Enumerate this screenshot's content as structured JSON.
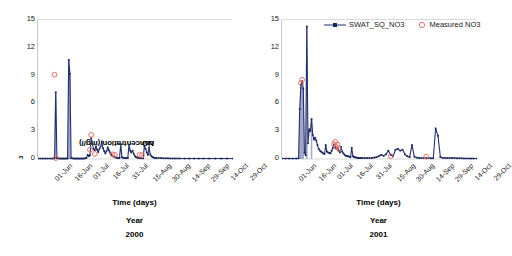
{
  "figure": {
    "ylabel": "NO3 concentration (mg/l)",
    "ylabel_prefix": "NO",
    "ylabel_sub": "3",
    "ylabel_suffix": " concentration (mg/l)",
    "colors": {
      "simulated_line": "#24306e",
      "simulated_marker": "#1b2559",
      "measured_marker": "#e8736c",
      "measured_fill": "#ffffff",
      "axis": "#c8c8c8",
      "gridline": "#d9d9d9",
      "text": "#1a1a1a",
      "spike_stem": "#8b90bc"
    },
    "legend": {
      "position": "top-right-of-right-panel",
      "entries": [
        {
          "label": "SWAT_SQ_NO3",
          "marker": "line-with-square-marker"
        },
        {
          "label": "Measured NO3",
          "marker": "open-circle"
        }
      ]
    }
  },
  "chart_data": [
    {
      "id": "panel-2000",
      "type": "line",
      "title": "",
      "xlabel": "Time (days)",
      "ylabel": "NO3 concentration (mg/l)",
      "caption_line1": "Year",
      "caption_line2": "2000",
      "grid": false,
      "ylim": [
        0,
        15
      ],
      "yticks": [
        0,
        3,
        6,
        9,
        12,
        15
      ],
      "xticklabels": [
        "01-Jun",
        "16-Jun",
        "01-Jul",
        "16-Jul",
        "31-Jul",
        "15-Aug",
        "30-Aug",
        "14-Sep",
        "29-Sep",
        "14-Oct",
        "29-Oct"
      ],
      "xlim_days": [
        0,
        165
      ],
      "series": [
        {
          "name": "SWAT_SQ_NO3",
          "x": [
            0,
            2,
            4,
            6,
            8,
            10,
            12,
            13,
            14,
            15,
            16,
            17,
            18,
            19,
            20,
            21,
            22,
            23,
            24,
            25,
            26,
            27,
            28,
            29,
            30,
            31,
            32,
            33,
            34,
            35,
            36,
            37,
            38,
            39,
            40,
            41,
            42,
            43,
            44,
            45,
            46,
            47,
            48,
            49,
            50,
            51,
            52,
            53,
            54,
            55,
            56,
            57,
            58,
            59,
            60,
            61,
            62,
            63,
            64,
            65,
            66,
            67,
            68,
            69,
            70,
            71,
            72,
            73,
            74,
            75,
            76,
            77,
            78,
            79,
            80,
            81,
            82,
            83,
            84,
            85,
            86,
            87,
            88,
            89,
            90,
            91,
            92,
            93,
            94,
            95,
            96,
            97,
            98,
            99,
            100,
            102,
            104,
            106,
            108,
            110,
            112,
            114,
            116,
            118,
            120,
            124,
            128,
            132,
            136,
            140,
            145,
            150,
            155,
            160,
            165
          ],
          "y": [
            0.05,
            0.05,
            0.05,
            0.05,
            0.05,
            0.05,
            0.05,
            0.05,
            0.08,
            7.2,
            0.1,
            0.08,
            0.05,
            0.05,
            0.05,
            0.05,
            0.05,
            0.05,
            0.05,
            0.05,
            10.7,
            9.2,
            0.1,
            0.08,
            0.05,
            0.05,
            0.05,
            0.05,
            0.05,
            0.05,
            0.05,
            0.05,
            0.05,
            0.05,
            0.08,
            0.12,
            0.45,
            0.3,
            0.4,
            2.3,
            1.65,
            1.1,
            0.95,
            1.35,
            1.0,
            0.75,
            1.1,
            1.35,
            1.9,
            1.15,
            0.85,
            0.6,
            0.85,
            1.25,
            0.95,
            0.7,
            0.5,
            0.35,
            0.25,
            0.2,
            0.15,
            0.12,
            0.1,
            0.1,
            1.6,
            0.2,
            0.12,
            0.1,
            0.1,
            0.1,
            0.12,
            1.55,
            0.9,
            0.7,
            0.9,
            0.55,
            0.3,
            0.2,
            0.15,
            0.12,
            0.1,
            0.1,
            0.08,
            0.08,
            1.4,
            1.1,
            0.7,
            0.45,
            1.25,
            0.5,
            0.3,
            0.2,
            0.15,
            0.12,
            0.1,
            0.1,
            0.1,
            0.08,
            0.08,
            0.08,
            0.06,
            0.06,
            0.06,
            0.06,
            0.06,
            0.05,
            0.05,
            0.05,
            0.05,
            0.05,
            0.05,
            0.05,
            0.05,
            0.05,
            0.05,
            0.05,
            0.05,
            0.05,
            0.05
          ]
        }
      ],
      "measured": {
        "name": "Measured NO3",
        "points": [
          {
            "x": 14,
            "y": 9.1
          },
          {
            "x": 15,
            "y": 0.1
          },
          {
            "x": 44,
            "y": 1.0
          },
          {
            "x": 45,
            "y": 2.6
          },
          {
            "x": 48,
            "y": 0.55
          },
          {
            "x": 63,
            "y": 0.5
          },
          {
            "x": 65,
            "y": 0.45
          },
          {
            "x": 86,
            "y": 0.45
          },
          {
            "x": 88,
            "y": 0.4
          }
        ]
      }
    },
    {
      "id": "panel-2001",
      "type": "line",
      "title": "",
      "xlabel": "Time (days)",
      "ylabel": "NO3 concentration (mg/l)",
      "caption_line1": "Year",
      "caption_line2": "2001",
      "grid": false,
      "ylim": [
        0,
        15
      ],
      "yticks": [
        0,
        3,
        6,
        9,
        12,
        15
      ],
      "xticklabels": [
        "01-Jun",
        "16-Jun",
        "01-Jul",
        "16-Jul",
        "31-Jul",
        "15-Aug",
        "30-Aug",
        "14-Sep",
        "29-Sep",
        "14-Oct",
        "29-Oct"
      ],
      "xlim_days": [
        0,
        165
      ],
      "series": [
        {
          "name": "SWAT_SQ_NO3",
          "x": [
            0,
            3,
            6,
            9,
            12,
            14,
            15,
            16,
            17,
            18,
            19,
            20,
            21,
            22,
            23,
            24,
            25,
            26,
            27,
            28,
            29,
            30,
            31,
            32,
            33,
            34,
            35,
            36,
            37,
            38,
            39,
            40,
            41,
            42,
            43,
            44,
            45,
            46,
            47,
            48,
            49,
            50,
            51,
            52,
            53,
            54,
            55,
            56,
            57,
            58,
            59,
            60,
            61,
            62,
            63,
            64,
            65,
            66,
            67,
            68,
            70,
            72,
            74,
            76,
            78,
            80,
            82,
            84,
            86,
            88,
            90,
            92,
            94,
            96,
            98,
            100,
            102,
            104,
            106,
            108,
            110,
            112,
            114,
            116,
            118,
            120,
            122,
            124,
            126,
            128,
            130,
            132,
            134,
            136,
            138,
            140,
            142,
            144,
            146,
            148,
            150,
            152,
            154,
            156,
            158,
            160,
            162,
            165
          ],
          "y": [
            0.05,
            0.05,
            0.05,
            0.05,
            0.05,
            0.08,
            5.4,
            8.0,
            8.4,
            7.6,
            0.7,
            0.4,
            14.3,
            1.7,
            3.2,
            3.0,
            4.3,
            2.6,
            2.1,
            2.3,
            2.0,
            1.5,
            1.1,
            0.9,
            0.8,
            0.7,
            0.6,
            0.55,
            1.5,
            0.8,
            0.7,
            0.65,
            0.6,
            0.9,
            1.2,
            1.55,
            1.3,
            1.1,
            1.2,
            0.9,
            0.7,
            1.3,
            0.8,
            0.6,
            0.45,
            0.35,
            0.3,
            0.3,
            0.25,
            0.22,
            1.2,
            0.3,
            0.2,
            0.18,
            0.15,
            0.12,
            0.1,
            0.1,
            0.1,
            0.1,
            0.1,
            0.1,
            0.1,
            0.12,
            0.15,
            0.2,
            0.3,
            0.45,
            0.35,
            0.5,
            0.9,
            0.45,
            0.3,
            1.0,
            1.1,
            0.9,
            1.0,
            0.5,
            0.3,
            0.2,
            1.5,
            0.25,
            0.15,
            0.12,
            0.1,
            0.1,
            0.1,
            0.1,
            0.08,
            0.08,
            3.3,
            2.5,
            0.2,
            0.12,
            0.1,
            0.1,
            0.1,
            0.1,
            0.1,
            0.08,
            0.08,
            0.08,
            0.06,
            0.06,
            0.06,
            0.05,
            0.05,
            0.05
          ]
        }
      ],
      "measured": {
        "points": [
          {
            "x": 16,
            "y": 8.2
          },
          {
            "x": 17,
            "y": 8.55
          },
          {
            "x": 44,
            "y": 1.6
          },
          {
            "x": 45,
            "y": 1.85
          },
          {
            "x": 46,
            "y": 1.3
          },
          {
            "x": 47,
            "y": 1.55
          },
          {
            "x": 48,
            "y": 1.1
          },
          {
            "x": 92,
            "y": 0.3
          },
          {
            "x": 122,
            "y": 0.25
          }
        ]
      }
    }
  ]
}
